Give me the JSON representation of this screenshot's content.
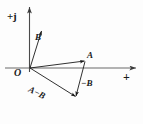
{
  "figure": {
    "background_color": "#fdfdfd",
    "stroke_color": "#1a1a1a",
    "axis_color": "#555555",
    "width": 143,
    "height": 124
  },
  "axes": {
    "vertical": {
      "label": "+j",
      "x": 29,
      "y_top": 5,
      "y_bottom": 72,
      "arrow": "up"
    },
    "horizontal": {
      "label": "+",
      "y": 68,
      "x_left": 5,
      "x_right": 137,
      "arrow": "right"
    },
    "origin": {
      "label": "O",
      "x": 30,
      "y": 68
    }
  },
  "vectors": [
    {
      "name": "B",
      "label": "B",
      "from": [
        30,
        68
      ],
      "to": [
        42,
        30
      ],
      "arrow": true
    },
    {
      "name": "A",
      "label": "A",
      "from": [
        30,
        68
      ],
      "to": [
        85,
        61
      ],
      "arrow": true
    },
    {
      "name": "minus-B",
      "label": "−B",
      "from": [
        85,
        61
      ],
      "to": [
        76,
        97
      ],
      "arrow": true
    },
    {
      "name": "A-minus-B",
      "label": "A−B",
      "from": [
        30,
        68
      ],
      "to": [
        76,
        97
      ],
      "arrow": true
    }
  ],
  "labels": {
    "imaginary_axis": "+j",
    "real_axis": "+",
    "origin": "O",
    "vector_b": "B",
    "vector_a": "A",
    "vector_neg_b": "−B",
    "vector_a_minus_b": "A−B"
  }
}
